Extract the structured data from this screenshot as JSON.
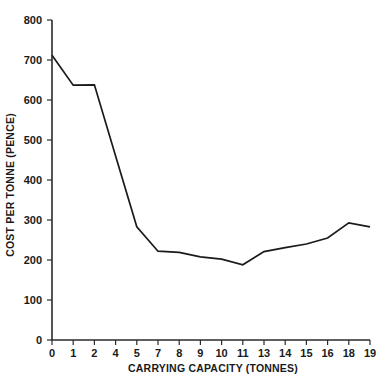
{
  "chart_data": {
    "type": "line",
    "title": "",
    "xlabel": "CARRYING CAPACITY (TONNES)",
    "ylabel": "COST PER TONNE (PENCE)",
    "categories": [
      "0",
      "1",
      "2",
      "4",
      "5",
      "7",
      "8",
      "9",
      "10",
      "11",
      "13",
      "14",
      "15",
      "16",
      "18",
      "19"
    ],
    "values": [
      712,
      637,
      638,
      460,
      283,
      222,
      219,
      208,
      202,
      188,
      221,
      231,
      240,
      255,
      293,
      283
    ],
    "series": [
      {
        "name": "Cost per tonne",
        "values": [
          712,
          637,
          638,
          460,
          283,
          222,
          219,
          208,
          202,
          188,
          221,
          231,
          240,
          255,
          293,
          283
        ]
      }
    ],
    "ylim": [
      0,
      800
    ],
    "yticks": [
      0,
      100,
      200,
      300,
      400,
      500,
      600,
      700,
      800
    ],
    "ytick_labels": [
      "0",
      "100",
      "200",
      "300",
      "400",
      "500",
      "600",
      "700",
      "800"
    ],
    "xtick_labels": [
      "0",
      "1",
      "2",
      "4",
      "5",
      "7",
      "8",
      "9",
      "10",
      "11",
      "13",
      "14",
      "15",
      "16",
      "18",
      "19"
    ],
    "grid": false,
    "legend": "none",
    "line_color": "#1a1a1a",
    "axis_color": "#2b2b2b",
    "background_color": "#ffffff"
  }
}
